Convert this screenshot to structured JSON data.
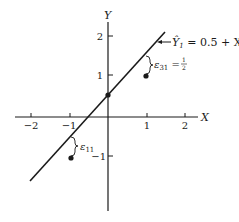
{
  "diagram": {
    "type": "regression-residual-plot",
    "axes": {
      "x_label": "X",
      "y_label": "Y",
      "x_ticks": [
        "−2",
        "−1",
        "1",
        "2"
      ],
      "y_ticks": [
        "2",
        "1",
        "−1"
      ]
    },
    "line": {
      "equation_lhs": "Ŷ",
      "equation_sub": "1",
      "equation_rhs": " = 0.5 + X"
    },
    "points": [
      {
        "x": -1,
        "y": -1
      },
      {
        "x": 0,
        "y": 0.5
      },
      {
        "x": 1,
        "y": 1
      }
    ],
    "residuals": [
      {
        "label": "ε",
        "sub": "11",
        "value_text": ""
      },
      {
        "label": "ε",
        "sub": "31",
        "value_text": " = ",
        "frac_num": "1",
        "frac_den": "2"
      }
    ],
    "colors": {
      "ink": "#1a1a1a",
      "background": "#ffffff"
    }
  }
}
